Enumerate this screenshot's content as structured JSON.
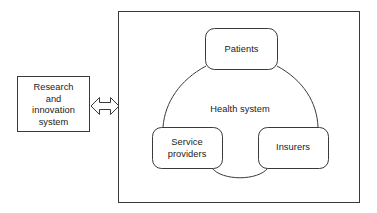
{
  "diagram": {
    "type": "system-relationship-diagram",
    "outer_container": {
      "name": "health-system-frame",
      "label": "Health system",
      "border_color": "#333333",
      "fill_color": "#ffffff"
    },
    "external_box": {
      "name": "research-and-innovation-system",
      "label": "Research\nand\ninnovation\nsystem",
      "border_color": "#333333",
      "fill_color": "#ffffff"
    },
    "connector": {
      "name": "bidirectional-arrow",
      "icon": "double-headed-arrow-icon",
      "direction": "bidirectional",
      "stroke_color": "#333333"
    },
    "nodes": [
      {
        "id": "patients",
        "label": "Patients",
        "shape": "rounded-rectangle",
        "border_color": "#333333",
        "fill_color": "#ffffff"
      },
      {
        "id": "service-providers",
        "label": "Service\nproviders",
        "shape": "rounded-rectangle",
        "border_color": "#333333",
        "fill_color": "#ffffff"
      },
      {
        "id": "insurers",
        "label": "Insurers",
        "shape": "rounded-rectangle",
        "border_color": "#333333",
        "fill_color": "#ffffff"
      }
    ],
    "arcs": [
      {
        "name": "arc-patients-to-service-providers",
        "from": "patients",
        "to": "service-providers"
      },
      {
        "name": "arc-patients-to-insurers",
        "from": "patients",
        "to": "insurers"
      },
      {
        "name": "arc-service-providers-to-insurers",
        "from": "service-providers",
        "to": "insurers"
      }
    ]
  }
}
